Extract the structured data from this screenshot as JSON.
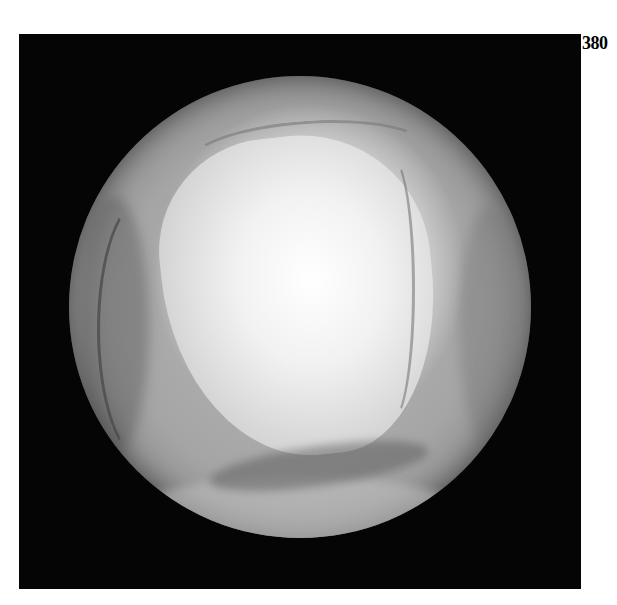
{
  "figure": {
    "label": "380"
  },
  "colors": {
    "background": "#ffffff",
    "frame": "#050505",
    "highlight": "#ffffff",
    "midtone": "#a5a5a5"
  }
}
